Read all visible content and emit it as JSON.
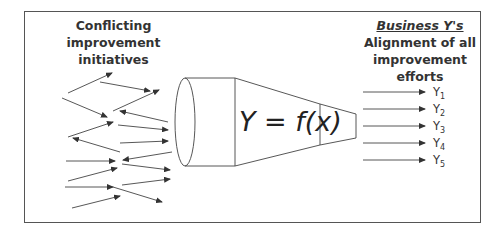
{
  "diagram": {
    "left_title": "Conflicting improvement initiatives",
    "right_title_top": "Business Y's",
    "right_title_bottom": "Alignment of all improvement efforts",
    "funnel_label": "Y = f(x)",
    "outputs": [
      {
        "base": "Y",
        "sub": "1"
      },
      {
        "base": "Y",
        "sub": "2"
      },
      {
        "base": "Y",
        "sub": "3"
      },
      {
        "base": "Y",
        "sub": "4"
      },
      {
        "base": "Y",
        "sub": "5"
      }
    ],
    "colors": {
      "line": "#444444",
      "text": "#333333",
      "border": "#555555"
    }
  }
}
